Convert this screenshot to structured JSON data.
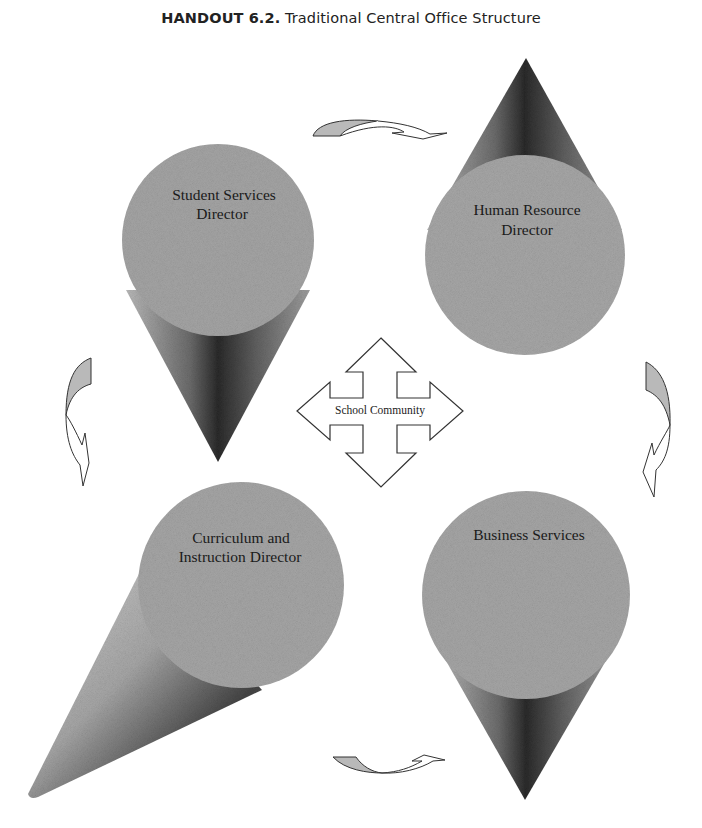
{
  "header": {
    "handout_label": "HANDOUT 6.2.",
    "title": "Traditional Central Office Structure"
  },
  "diagram": {
    "center": {
      "label": "School Community",
      "shape": "four-way-arrow"
    },
    "nodes": [
      {
        "id": "student-services",
        "line1": "Student Services",
        "line2": "Director",
        "position": "top-left",
        "cone_points": "down"
      },
      {
        "id": "human-resource",
        "line1": "Human Resource",
        "line2": "Director",
        "position": "top-right",
        "cone_points": "up"
      },
      {
        "id": "curriculum-instruction",
        "line1": "Curriculum and",
        "line2": "Instruction Director",
        "position": "bottom-left",
        "cone_points": "down-left"
      },
      {
        "id": "business-services",
        "line1": "Business Services",
        "line2": "",
        "position": "bottom-right",
        "cone_points": "down"
      }
    ],
    "cycle_arrows": [
      {
        "id": "arrow-top",
        "from": "student-services",
        "to": "human-resource",
        "direction": "right"
      },
      {
        "id": "arrow-right",
        "from": "human-resource",
        "to": "business-services",
        "direction": "down"
      },
      {
        "id": "arrow-bottom",
        "from": "curriculum-instruction",
        "to": "business-services",
        "direction": "right"
      },
      {
        "id": "arrow-left",
        "from": "student-services",
        "to": "curriculum-instruction",
        "direction": "down"
      }
    ],
    "colors": {
      "disc": "#a3a3a3",
      "cone_dark": "#2e2e2e",
      "cone_light": "#b8b8b8",
      "arrow_fill": "#b9b9b9",
      "outline": "#333333"
    }
  }
}
